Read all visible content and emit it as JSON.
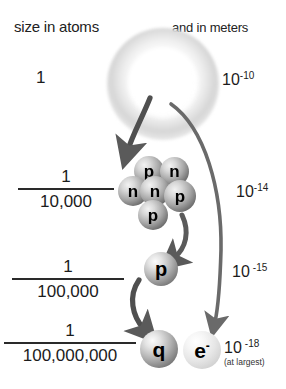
{
  "headers": {
    "left": "size in atoms",
    "right": "and in meters"
  },
  "rows": [
    {
      "id": "atom",
      "atoms_label": "1",
      "meters_mantissa": "10",
      "meters_exponent": "-10",
      "object": "atom",
      "object_label": ""
    },
    {
      "id": "nucleus",
      "atoms_numerator": "1",
      "atoms_denominator": "10,000",
      "meters_mantissa": "10",
      "meters_exponent": "-14",
      "object": "nucleus",
      "object_label": ""
    },
    {
      "id": "proton",
      "atoms_numerator": "1",
      "atoms_denominator": "100,000",
      "meters_mantissa": "10",
      "meters_exponent": "-15",
      "object": "proton",
      "object_label": "p"
    },
    {
      "id": "quark",
      "atoms_numerator": "1",
      "atoms_denominator": "100,000,000",
      "meters_mantissa": "10",
      "meters_exponent": "-18",
      "meters_note": "(at largest)",
      "object": "quark",
      "object_label": "q"
    }
  ],
  "nucleus": {
    "nucleons": [
      {
        "label": "p",
        "kind": "proton"
      },
      {
        "label": "n",
        "kind": "neutron"
      },
      {
        "label": "n",
        "kind": "neutron"
      },
      {
        "label": "n",
        "kind": "neutron"
      },
      {
        "label": "p",
        "kind": "proton"
      },
      {
        "label": "p",
        "kind": "proton"
      }
    ]
  },
  "particles": {
    "proton_label": "p",
    "quark_label": "q",
    "electron_label": "e",
    "electron_charge": "-"
  },
  "colors": {
    "background": "#ffffff",
    "text": "#1a1a1a",
    "arrow": "#5a5a5a",
    "sphere_dark": "#555555",
    "sphere_light": "#c2c2c2"
  }
}
